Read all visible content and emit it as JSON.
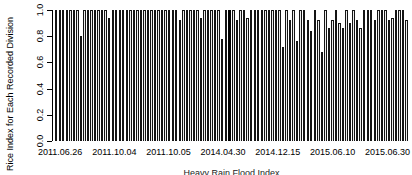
{
  "chart_data": {
    "type": "bar",
    "title": "",
    "ylabel": "Rice Index for Each Recorded Division",
    "xlabel": "Heavy Rain Flood Index",
    "ylim": [
      0.0,
      1.0
    ],
    "grid": false,
    "legend": "none",
    "bar_fill_color": "#ffffff",
    "bar_border_color": "#000000",
    "highlight_bar": {
      "index": 49,
      "color": "#000000"
    },
    "y_tick_labels": [
      "0.0",
      "0.2",
      "0.4",
      "0.6",
      "0.8",
      "1.0"
    ],
    "y_tick_values": [
      0.0,
      0.2,
      0.4,
      0.6,
      0.8,
      1.0
    ],
    "x_tick_labels": [
      "2011.06.26",
      "2011.10.04",
      "2011.10.05",
      "2014.04.30",
      "2014.12.15",
      "2015.06.10",
      "2015.06.30"
    ],
    "values": [
      1.0,
      1.0,
      1.0,
      1.0,
      1.0,
      1.0,
      1.0,
      0.8,
      1.0,
      1.0,
      1.0,
      1.0,
      1.0,
      1.0,
      1.0,
      0.94,
      1.0,
      1.0,
      1.0,
      1.0,
      1.0,
      1.0,
      1.0,
      1.0,
      1.0,
      1.0,
      1.0,
      1.0,
      1.0,
      1.0,
      1.0,
      1.0,
      1.0,
      1.0,
      1.0,
      0.92,
      1.0,
      1.0,
      1.0,
      1.0,
      1.0,
      0.94,
      1.0,
      1.0,
      1.0,
      1.0,
      1.0,
      0.78,
      1.0,
      1.0,
      1.0,
      0.92,
      1.0,
      1.0,
      0.94,
      1.0,
      1.0,
      1.0,
      1.0,
      1.0,
      1.0,
      1.0,
      1.0,
      1.0,
      0.72,
      1.0,
      0.92,
      1.0,
      0.76,
      1.0,
      1.0,
      0.92,
      0.84,
      1.0,
      0.92,
      0.68,
      1.0,
      0.86,
      0.92,
      1.0,
      0.9,
      0.86,
      1.0,
      0.9,
      1.0,
      0.92,
      0.86,
      1.0,
      1.0,
      1.0,
      0.92,
      1.0,
      1.0,
      1.0,
      0.92,
      0.94,
      1.0,
      1.0,
      1.0,
      0.92
    ]
  }
}
